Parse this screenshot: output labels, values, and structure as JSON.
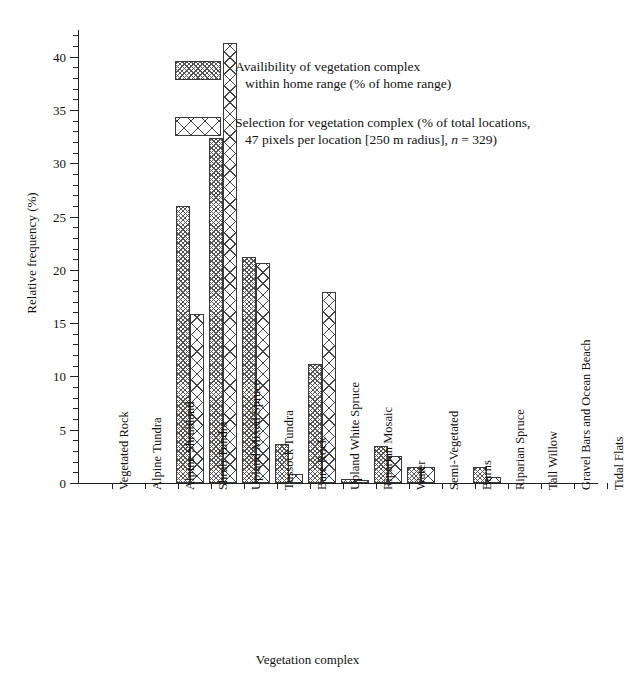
{
  "chart_data": {
    "type": "bar",
    "title": "",
    "xlabel": "Vegetation complex",
    "ylabel": "Relative frequency (%)",
    "ylim": [
      0,
      42.5
    ],
    "yticks": [
      0,
      5,
      10,
      15,
      20,
      25,
      30,
      35,
      40
    ],
    "ytick_labels": [
      "0",
      "5",
      "10",
      "15",
      "20",
      "25",
      "30",
      "35",
      "40"
    ],
    "minor_tick_step": 1,
    "grid": false,
    "legend_position": "upper-center-right",
    "categories": [
      "Vegetated Rock",
      "Alpine Tundra",
      "Alpine Shrubland",
      "Shrub Tundra",
      "Upland Mixed Spruce",
      "Tussock Tundra",
      "Bare Rock",
      "Upland White Spruce",
      "Riparian Mosaic",
      "Water",
      "Semi-Vegetated",
      "Burns",
      "Riparian Spruce",
      "Tall Willow",
      "Gravel Bars and Ocean Beach",
      "Tidal Flats"
    ],
    "series": [
      {
        "name": "Availibility of vegetation complex within home range (% of home range)",
        "key": "avail",
        "values": [
          26.0,
          32.4,
          21.2,
          3.7,
          11.2,
          0.4,
          3.5,
          1.5,
          0.0,
          1.5,
          0.0,
          0.0,
          0.0,
          0.0,
          0.0,
          0.0
        ]
      },
      {
        "name": "Selection for vegetation complex (% of total locations, 47 pixels per location [250 m radius], n = 329)",
        "key": "sel",
        "values": [
          15.9,
          41.3,
          20.6,
          0.8,
          17.9,
          0.3,
          2.5,
          1.5,
          0.0,
          0.6,
          0.0,
          0.0,
          0.0,
          0.0,
          0.0,
          0.0
        ]
      }
    ]
  },
  "axes": {
    "ylabel": "Relative frequency (%)",
    "xlabel": "Vegetation complex"
  },
  "legend": {
    "items": [
      {
        "swatch": "avail",
        "line1": "Availibility of vegetation complex",
        "line2": "within home range (% of home range)"
      },
      {
        "swatch": "sel",
        "line1": "Selection for vegetation complex (% of total locations,",
        "line2_pre": "47 pixels per location [250 m radius], ",
        "line2_italic": "n",
        "line2_post": " = 329)"
      }
    ]
  },
  "colors": {
    "axis": "#222222",
    "hatch": "#4a4a4a",
    "background": "#ffffff"
  }
}
